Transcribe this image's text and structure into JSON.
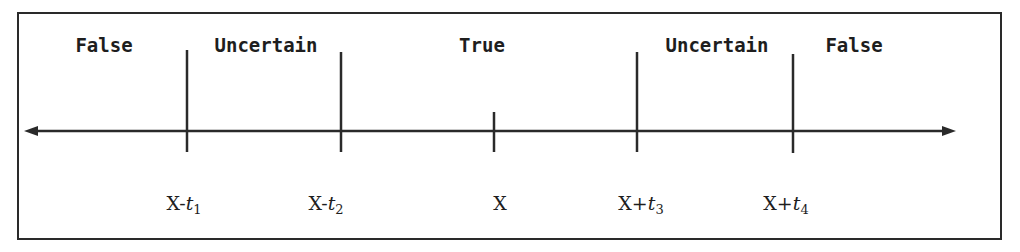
{
  "diagram": {
    "type": "number-line-regions",
    "regions": [
      {
        "label": "False",
        "x": 104
      },
      {
        "label": "Uncertain",
        "x": 266
      },
      {
        "label": "True",
        "x": 482
      },
      {
        "label": "Uncertain",
        "x": 717
      },
      {
        "label": "False",
        "x": 854
      }
    ],
    "ticks": [
      {
        "base": "X-",
        "var": "t",
        "sub": "1",
        "x": 187,
        "major": true
      },
      {
        "base": "X-",
        "var": "t",
        "sub": "2",
        "x": 341,
        "major": true
      },
      {
        "base": "X",
        "var": "",
        "sub": "",
        "x": 494,
        "major": false
      },
      {
        "base": "X+",
        "var": "t",
        "sub": "3",
        "x": 637,
        "major": true
      },
      {
        "base": "X+",
        "var": "t",
        "sub": "4",
        "x": 793,
        "major": true
      }
    ],
    "axis": {
      "x_start": 24,
      "x_end": 955,
      "y": 131,
      "arrows": "both"
    },
    "colors": {
      "stroke": "#2a2a2a",
      "text": "#1e1e1e",
      "background": "#ffffff"
    }
  }
}
